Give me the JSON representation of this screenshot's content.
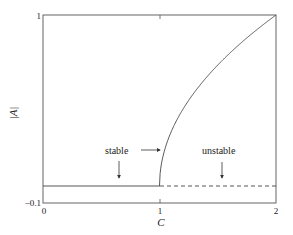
{
  "chart_data": {
    "type": "line",
    "title": "",
    "xlabel": "C",
    "ylabel": "|A|",
    "xlim": [
      0,
      2
    ],
    "ylim": [
      -0.1,
      1
    ],
    "grid": false,
    "x_ticks": [
      {
        "value": 0,
        "label": "0"
      },
      {
        "value": 1,
        "label": "1"
      },
      {
        "value": 2,
        "label": "2"
      }
    ],
    "y_ticks": [
      {
        "value": -0.1,
        "label": "−0.1"
      },
      {
        "value": 1,
        "label": "1"
      }
    ],
    "series": [
      {
        "name": "trivial stable branch",
        "style": "solid",
        "x": [
          0,
          1
        ],
        "y": [
          0,
          0
        ]
      },
      {
        "name": "trivial unstable branch",
        "style": "dashed",
        "x": [
          1,
          2
        ],
        "y": [
          0,
          0
        ]
      },
      {
        "name": "bifurcating branch |A| = sqrt(C-1)",
        "style": "solid",
        "x": [
          1.0,
          1.01,
          1.05,
          1.1,
          1.2,
          1.3,
          1.4,
          1.5,
          1.6,
          1.7,
          1.8,
          1.9,
          2.0
        ],
        "y": [
          0.0,
          0.1,
          0.224,
          0.316,
          0.447,
          0.548,
          0.632,
          0.707,
          0.775,
          0.837,
          0.894,
          0.949,
          1.0
        ]
      }
    ],
    "annotations": [
      {
        "text": "stable",
        "arrows": [
          "down to stable trivial branch at C≈0.65",
          "right to bifurcating branch near C=1"
        ]
      },
      {
        "text": "unstable",
        "arrows": [
          "down to dashed trivial branch at C≈1.55"
        ]
      }
    ]
  },
  "labels": {
    "xlabel": "C",
    "ylabel": "|A|",
    "x0": "0",
    "x1": "1",
    "x2": "2",
    "ytop": "1",
    "ybottom": "−0.1",
    "stable": "stable",
    "unstable": "unstable"
  }
}
